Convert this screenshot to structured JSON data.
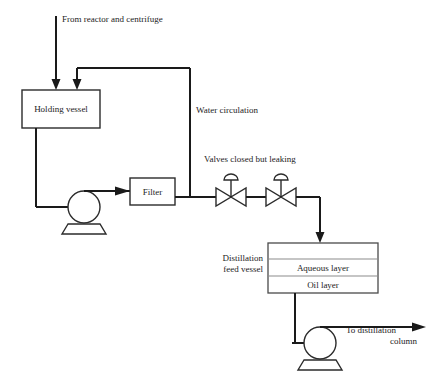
{
  "diagram": {
    "background_color": "#ffffff",
    "line_color": "#1a1a1a",
    "vessel_outline_color": "#4a4a4a",
    "labels": {
      "feed_stream": "From reactor and centrifuge",
      "recycle_stream": "Water circulation",
      "valves_note": "Valves closed but leaking",
      "outlet_stream_line1": "To distillation",
      "outlet_stream_line2": "column"
    },
    "equipment": {
      "holding_vessel": "Holding vessel",
      "filter": "Filter",
      "feed_vessel_line1": "Distillation",
      "feed_vessel_line2": "feed vessel",
      "aqueous_layer": "Aqueous layer",
      "oil_layer": "Oil layer"
    },
    "icons": {
      "pump_circulation": "pump-icon",
      "pump_discharge": "pump-icon",
      "valve_first": "gate-valve-icon",
      "valve_second": "gate-valve-icon",
      "arrow_feed": "arrow-down-icon",
      "arrow_recycle": "arrow-down-icon",
      "arrow_to_vessel": "arrow-down-icon",
      "arrow_to_column": "arrow-right-icon"
    }
  }
}
